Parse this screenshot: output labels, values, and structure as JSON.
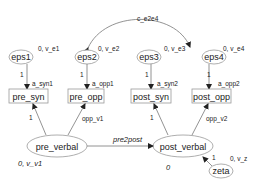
{
  "diagram": {
    "type": "structural-equation-model",
    "errors": [
      {
        "id": "eps1",
        "label": "eps1",
        "annotation": "0, v_e1"
      },
      {
        "id": "eps2",
        "label": "eps2",
        "annotation": "0, v_e2"
      },
      {
        "id": "eps3",
        "label": "eps3",
        "annotation": "0, v_e3"
      },
      {
        "id": "eps4",
        "label": "eps4",
        "annotation": "0, v_e4"
      }
    ],
    "observed": [
      {
        "id": "pre_syn",
        "label": "pre_syn"
      },
      {
        "id": "pre_opp",
        "label": "pre_opp"
      },
      {
        "id": "post_syn",
        "label": "post_syn"
      },
      {
        "id": "post_opp",
        "label": "post_opp"
      }
    ],
    "latent": [
      {
        "id": "pre_verbal",
        "label": "pre_verbal",
        "annotation": "0, v_v1"
      },
      {
        "id": "post_verbal",
        "label": "post_verbal",
        "annotation": "0"
      }
    ],
    "disturbance": {
      "id": "zeta",
      "label": "zeta",
      "annotation": "0, v_z"
    },
    "paths": [
      {
        "from": "eps1",
        "to": "pre_syn",
        "coef_label": "1",
        "intercept_label": "a_syn1"
      },
      {
        "from": "eps2",
        "to": "pre_opp",
        "coef_label": "1",
        "intercept_label": "a_opp1"
      },
      {
        "from": "eps3",
        "to": "post_syn",
        "coef_label": "1",
        "intercept_label": "a_syn2"
      },
      {
        "from": "eps4",
        "to": "post_opp",
        "coef_label": "1",
        "intercept_label": "a_opp2"
      },
      {
        "from": "pre_verbal",
        "to": "pre_syn",
        "label": "1"
      },
      {
        "from": "pre_verbal",
        "to": "pre_opp",
        "label": "opp_v1"
      },
      {
        "from": "post_verbal",
        "to": "post_syn",
        "label": "1"
      },
      {
        "from": "post_verbal",
        "to": "post_opp",
        "label": "opp_v2"
      },
      {
        "from": "pre_verbal",
        "to": "post_verbal",
        "label": "pre2post"
      },
      {
        "from": "zeta",
        "to": "post_verbal",
        "label": "1"
      }
    ],
    "covariance": {
      "between": [
        "eps2",
        "eps4"
      ],
      "label": "c_e2e4"
    }
  }
}
